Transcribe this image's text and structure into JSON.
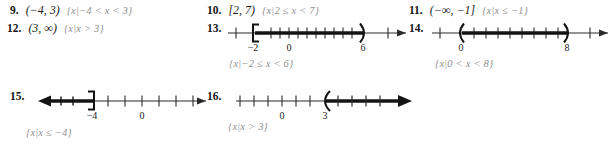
{
  "page": {
    "type": "math-answer-key",
    "width": 613,
    "height": 148,
    "ink_color": "#1a1a1a",
    "answer_color": "#8f8f8f"
  },
  "problems": [
    {
      "number": "9.",
      "interval": "(−4, 3)",
      "setbuilder": "{x|−4 < x < 3}",
      "has_graph": false
    },
    {
      "number": "10.",
      "interval": "[2, 7)",
      "setbuilder": "{x|2 ≤ x < 7}",
      "has_graph": false
    },
    {
      "number": "11.",
      "interval": "(−∞, −1]",
      "setbuilder": "{x|x ≤ −1}",
      "has_graph": false
    },
    {
      "number": "12.",
      "interval": "(3, ∞)",
      "setbuilder": "{x|x > 3}",
      "has_graph": false
    },
    {
      "number": "13.",
      "interval": "",
      "setbuilder": "{x|−2 ≤ x < 6}",
      "has_graph": true,
      "graph": {
        "left_bracket": "[",
        "right_bracket": ")",
        "left_label": "−2",
        "right_label": "6",
        "zero_label": "0",
        "shaded_from": "−2",
        "shaded_to": "6",
        "left_arrow": false,
        "right_arrow": false
      }
    },
    {
      "number": "14.",
      "interval": "",
      "setbuilder": "{x|0 < x < 8}",
      "has_graph": true,
      "graph": {
        "left_bracket": "(",
        "right_bracket": ")",
        "left_label": "0",
        "right_label": "8",
        "zero_label": "",
        "shaded_from": "0",
        "shaded_to": "8",
        "left_arrow": false,
        "right_arrow": false
      }
    },
    {
      "number": "15.",
      "interval": "",
      "setbuilder": "{x|x ≤ −4}",
      "has_graph": true,
      "graph": {
        "left_bracket": "",
        "right_bracket": "]",
        "left_label": "−4",
        "right_label": "",
        "zero_label": "0",
        "shaded_from": "−∞",
        "shaded_to": "−4",
        "left_arrow": true,
        "right_arrow": false
      }
    },
    {
      "number": "16.",
      "interval": "",
      "setbuilder": "{x|x > 3}",
      "has_graph": true,
      "graph": {
        "left_bracket": "(",
        "right_bracket": "",
        "left_label": "3",
        "right_label": "",
        "zero_label": "0",
        "shaded_from": "3",
        "shaded_to": "∞",
        "left_arrow": false,
        "right_arrow": true
      }
    }
  ]
}
